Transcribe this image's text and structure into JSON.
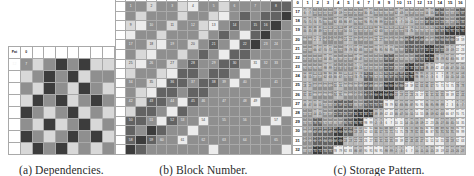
{
  "figure": {
    "panels": [
      {
        "id": "a",
        "caption": "(a) Dependencies."
      },
      {
        "id": "b",
        "caption": "(b) Block Number."
      },
      {
        "id": "c",
        "caption": "(c) Storage Pattern."
      }
    ]
  },
  "palette": {
    "white": "#ffffff",
    "grid_line": "#a9a9a9",
    "light_gray": "#d8d8d8",
    "mid_light_gray": "#b9b9b9",
    "mid_gray": "#8f8f8f",
    "dark_gray": "#636363",
    "darkest_gray": "#3c3c3c",
    "very_light": "#ececec",
    "text_light": "#f2f2f2",
    "text_dark": "#1c1c1c"
  },
  "panel_a": {
    "caption": "(a) Dependencies.",
    "rows": 9,
    "cols": 9,
    "header_labels": [
      "Pat",
      "0"
    ],
    "row_label": "12",
    "first_cell_label": "7",
    "cells": [
      [
        null,
        null,
        null,
        null,
        null,
        null,
        null,
        null,
        null
      ],
      [
        null,
        "m",
        "l",
        "m",
        "d",
        "m",
        "d",
        "l",
        null
      ],
      [
        null,
        "l",
        "m",
        "d",
        "m",
        "d",
        "l",
        "m"
      ],
      [
        null,
        "m",
        "l",
        "d",
        "m",
        "l",
        "d",
        "m"
      ],
      [
        null,
        "l",
        "d",
        "m",
        "d",
        "l",
        "m",
        "d"
      ],
      [
        null,
        "d",
        "m",
        "l",
        "m",
        "d",
        "l",
        "m"
      ],
      [
        null,
        "m",
        "l",
        "d",
        "l",
        "m",
        "d",
        "l"
      ],
      [
        null,
        "d",
        "m",
        "l",
        "m",
        "d",
        "m",
        "d"
      ],
      [
        null,
        "l",
        "d",
        "m",
        "d",
        "l",
        "m",
        "l"
      ]
    ]
  },
  "panel_b": {
    "caption": "(b) Block Number.",
    "rows": 16,
    "cols": 16,
    "block_numbers": [
      [
        1,
        null,
        2,
        null,
        3,
        null,
        4,
        null,
        5,
        null,
        6,
        null,
        7,
        null,
        8,
        null
      ],
      [
        null,
        null,
        null,
        null,
        null,
        null,
        null,
        null,
        null,
        null,
        null,
        null,
        null,
        null,
        null,
        null
      ],
      [
        9,
        null,
        10,
        null,
        11,
        null,
        12,
        null,
        13,
        null,
        14,
        null,
        15,
        16,
        null,
        null
      ],
      [
        null,
        null,
        null,
        null,
        null,
        null,
        null,
        null,
        null,
        null,
        null,
        null,
        null,
        null,
        null,
        null
      ],
      [
        17,
        null,
        18,
        null,
        19,
        null,
        20,
        null,
        21,
        null,
        null,
        22,
        null,
        23,
        24,
        null
      ],
      [
        null,
        null,
        null,
        null,
        null,
        null,
        null,
        null,
        null,
        null,
        null,
        null,
        null,
        null,
        null,
        null
      ],
      [
        25,
        null,
        26,
        null,
        27,
        null,
        28,
        null,
        29,
        null,
        30,
        null,
        31,
        32,
        33,
        null
      ],
      [
        null,
        null,
        null,
        null,
        null,
        null,
        null,
        null,
        null,
        null,
        null,
        null,
        null,
        null,
        null,
        null
      ],
      [
        34,
        null,
        35,
        null,
        36,
        null,
        37,
        null,
        38,
        39,
        null,
        40,
        null,
        null,
        41,
        null
      ],
      [
        null,
        null,
        null,
        null,
        null,
        null,
        null,
        null,
        null,
        null,
        null,
        null,
        null,
        null,
        null,
        null
      ],
      [
        42,
        null,
        43,
        null,
        44,
        null,
        45,
        46,
        null,
        47,
        null,
        48,
        49,
        null,
        null,
        null
      ],
      [
        null,
        null,
        null,
        null,
        null,
        null,
        null,
        null,
        null,
        null,
        null,
        null,
        null,
        null,
        null,
        null
      ],
      [
        50,
        null,
        51,
        null,
        52,
        53,
        null,
        54,
        null,
        55,
        null,
        56,
        null,
        null,
        57,
        null
      ],
      [
        null,
        null,
        null,
        null,
        null,
        null,
        null,
        null,
        null,
        null,
        null,
        null,
        null,
        null,
        null,
        null
      ],
      [
        58,
        null,
        59,
        60,
        null,
        61,
        null,
        62,
        null,
        63,
        null,
        64,
        null,
        null,
        65,
        null
      ],
      [
        null,
        null,
        null,
        null,
        null,
        null,
        null,
        null,
        null,
        null,
        null,
        null,
        null,
        null,
        null,
        null
      ]
    ]
  },
  "panel_c": {
    "caption": "(c) Storage Pattern.",
    "rows": 16,
    "cols": 16,
    "corner_label": "0",
    "col_headers": [
      "1",
      "2",
      "3",
      "4",
      "5",
      "6",
      "7",
      "8",
      "9",
      "10",
      "11",
      "12",
      "13",
      "14",
      "15",
      "16"
    ],
    "row_headers": [
      "17",
      "18",
      "19",
      "20",
      "21",
      "22",
      "23",
      "24",
      "25",
      "26",
      "27",
      "28",
      "29",
      "30",
      "31",
      "32"
    ]
  }
}
